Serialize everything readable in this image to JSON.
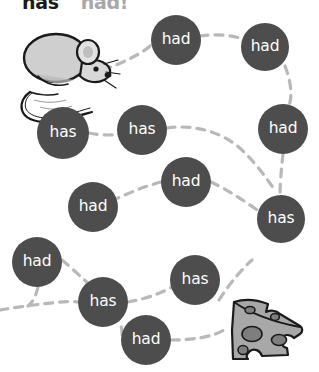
{
  "worksheet": {
    "title": {
      "primary": "has",
      "secondary": "had",
      "punctuation": "!"
    },
    "instruction_visible": "has had!",
    "colors": {
      "bubble_fill": "#4d4d4d",
      "bubble_text": "#ffffff",
      "path_dash": "#b8b8b8",
      "page_background": "#ffffff",
      "mouse_body": "#cccccc",
      "mouse_outline": "#1a1a1a",
      "cheese_fill": "#a6a6a6",
      "cheese_outline": "#1a1a1a",
      "title_primary": "#1a1a1a",
      "title_secondary": "#a8a8a8"
    },
    "start_icon": {
      "name": "mouse",
      "x": 14,
      "y": 28,
      "width": 100,
      "height": 72
    },
    "end_icon": {
      "name": "cheese",
      "x": 228,
      "y": 296,
      "width": 76,
      "height": 64
    },
    "bubbles": [
      {
        "label": "had",
        "cx": 176,
        "cy": 40,
        "r": 25
      },
      {
        "label": "had",
        "cx": 265,
        "cy": 47,
        "r": 24
      },
      {
        "label": "had",
        "cx": 283,
        "cy": 129,
        "r": 25
      },
      {
        "label": "has",
        "cx": 63,
        "cy": 133,
        "r": 26
      },
      {
        "label": "has",
        "cx": 142,
        "cy": 130,
        "r": 25
      },
      {
        "label": "had",
        "cx": 186,
        "cy": 182,
        "r": 25
      },
      {
        "label": "had",
        "cx": 93,
        "cy": 207,
        "r": 25
      },
      {
        "label": "has",
        "cx": 281,
        "cy": 219,
        "r": 24
      },
      {
        "label": "had",
        "cx": 37,
        "cy": 262,
        "r": 25
      },
      {
        "label": "has",
        "cx": 195,
        "cy": 280,
        "r": 25
      },
      {
        "label": "has",
        "cx": 103,
        "cy": 302,
        "r": 25
      },
      {
        "label": "had",
        "cx": 146,
        "cy": 340,
        "r": 25
      }
    ],
    "paths": [
      {
        "name": "upper-route",
        "d": "M 103 70 C 125 62 145 52 152 44 M 200 36 C 218 33 238 36 248 41 M 285 66 C 293 86 292 104 287 108"
      },
      {
        "name": "right-descent",
        "d": "M 283 154 C 281 172 280 186 280 196"
      },
      {
        "name": "middle-route",
        "d": "M 89 133 C 104 136 115 135 118 134 M 167 128 C 195 124 224 132 244 152 C 258 166 268 180 276 192"
      },
      {
        "name": "center-link",
        "d": "M 161 182 C 145 186 132 192 118 198 M 211 182 C 228 190 246 202 260 212"
      },
      {
        "name": "lower-route",
        "d": "M 38 287 C 36 296 33 302 28 306 M 0 310 C 30 305 70 300 78 302 M 128 302 C 150 298 163 292 172 287"
      },
      {
        "name": "bottom-route",
        "d": "M 62 260 C 95 288 125 318 122 336 M 171 340 C 196 340 214 336 224 330 M 219 300 C 232 280 245 266 252 260"
      }
    ]
  }
}
